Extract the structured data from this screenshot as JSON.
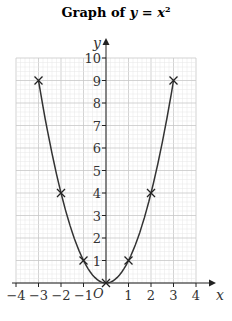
{
  "title_prefix": "Graph of ",
  "title_var": "y",
  "title_eq": " = ",
  "title_x": "x",
  "title_pow": "2",
  "chart_data": {
    "type": "line",
    "xlabel": "x",
    "ylabel": "y",
    "origin_label": "O",
    "xlim": [
      -4,
      4
    ],
    "ylim": [
      0,
      10
    ],
    "x_ticks": [
      -4,
      -3,
      -2,
      -1,
      1,
      2,
      3,
      4
    ],
    "y_ticks": [
      1,
      2,
      3,
      4,
      5,
      6,
      7,
      8,
      9,
      10
    ],
    "grid": true,
    "x": [
      -3,
      -2,
      -1,
      0,
      1,
      2,
      3
    ],
    "y": [
      9,
      4,
      1,
      0,
      1,
      4,
      9
    ],
    "marker": "x"
  }
}
